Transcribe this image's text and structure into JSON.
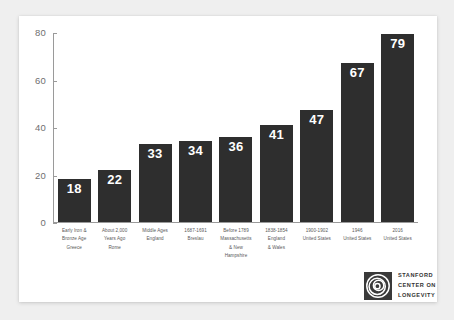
{
  "chart_data": {
    "type": "bar",
    "title": "",
    "subtitle": "",
    "xlabel": "",
    "ylabel": "",
    "ylim": [
      0,
      80
    ],
    "yticks": [
      "0",
      "20",
      "40",
      "60",
      "80"
    ],
    "grid": false,
    "legend": "none",
    "bar_color": "#2e2e2e",
    "value_label_color": "#ffffff",
    "categories": [
      "Early Iron & Bronze Age Greece",
      "About 2,000 Years Ago Rome",
      "Middle Ages England",
      "1687-1691 Breslau",
      "Before 1789 Massachusetts & New Hampshire",
      "1838-1854 England & Wales",
      "1900-1902 United States",
      "1946 United States",
      "2016 United States"
    ],
    "category_lines": [
      [
        "Early Iron &",
        "Bronze Age",
        "Greece"
      ],
      [
        "About 2,000",
        "Years Ago",
        "Rome"
      ],
      [
        "Middle Ages",
        "England"
      ],
      [
        "1687-1691",
        "Breslau"
      ],
      [
        "Before 1789",
        "Massachusetts",
        "& New",
        "Hampshire"
      ],
      [
        "1838-1854",
        "England",
        "& Wales"
      ],
      [
        "1900-1902",
        "United States"
      ],
      [
        "1946",
        "United States"
      ],
      [
        "2016",
        "United States"
      ]
    ],
    "values": [
      18,
      22,
      33,
      34,
      36,
      41,
      47,
      67,
      79
    ]
  },
  "logo": {
    "mark_name": "concentric-spiral-logo",
    "lines": [
      "STANFORD",
      "CENTER ON",
      "LONGEVITY"
    ]
  }
}
